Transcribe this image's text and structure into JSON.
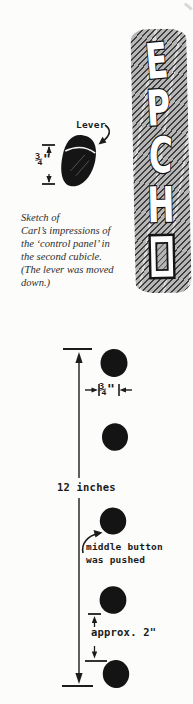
{
  "page": {
    "background": "#fcfcfb",
    "ink": "#1b1b1b"
  },
  "top_sketch": {
    "lever_label": "Lever",
    "lever_width_label": "¾\"",
    "caption_lines": [
      "Sketch of",
      "Carl’s impressions of",
      "the ‘control panel’ in",
      "the second cubicle.",
      "(The lever was moved",
      "down.)"
    ],
    "panel": {
      "letters": [
        "E",
        "P",
        "C",
        "H"
      ],
      "hatch_base": "#b6b6b6",
      "hatch_line": "#2e2e2e"
    }
  },
  "bottom_sketch": {
    "button_count": 5,
    "button_spacing_label": "¾\"",
    "total_height_label": "12 inches",
    "pushed_note_line1": "middle button",
    "pushed_note_line2": "was pushed",
    "bottom_gap_label": "approx. 2\""
  }
}
